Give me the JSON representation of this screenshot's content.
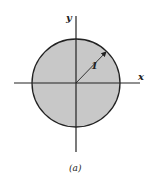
{
  "diagram": {
    "x_axis_label": "x",
    "y_axis_label": "y",
    "radius_label": "1",
    "caption": "(a)",
    "colors": {
      "fill": "#c8c8c8",
      "stroke": "#222222",
      "background": "#ffffff"
    }
  }
}
